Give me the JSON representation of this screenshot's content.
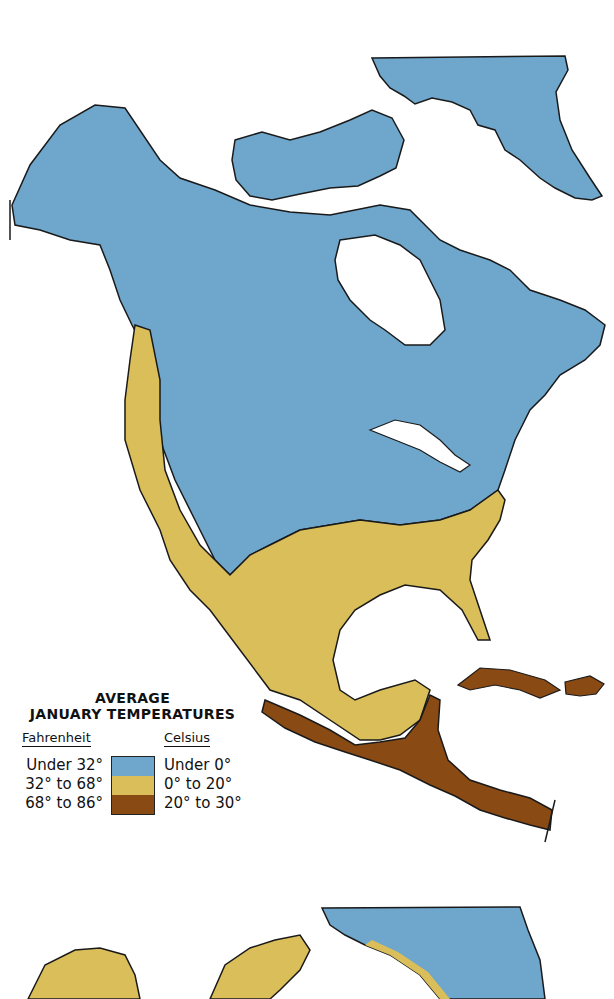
{
  "map": {
    "title_line1": "AVERAGE",
    "title_line2": "JANUARY TEMPERATURES",
    "region": "North America",
    "colors": {
      "water": "#ffffff",
      "cold": "#6ea6cc",
      "mild": "#d9be5a",
      "warm": "#8a4a14",
      "outline": "#1a1a1a"
    }
  },
  "legend": {
    "fahrenheit_label": "Fahrenheit",
    "celsius_label": "Celsius",
    "classes": [
      {
        "fahrenheit": "Under 32°",
        "celsius": "Under 0°",
        "color": "#6ea6cc"
      },
      {
        "fahrenheit": "32° to 68°",
        "celsius": "0° to 20°",
        "color": "#d9be5a"
      },
      {
        "fahrenheit": "68° to 86°",
        "celsius": "20° to 30°",
        "color": "#8a4a14"
      }
    ]
  }
}
